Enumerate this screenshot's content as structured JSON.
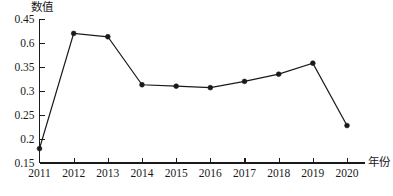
{
  "chart_data": {
    "type": "line",
    "title": "",
    "xlabel": "年份",
    "ylabel": "数值",
    "categories": [
      "2011",
      "2012",
      "2013",
      "2014",
      "2015",
      "2016",
      "2017",
      "2018",
      "2019",
      "2020"
    ],
    "values": [
      0.18,
      0.42,
      0.413,
      0.313,
      0.31,
      0.307,
      0.32,
      0.335,
      0.358,
      0.228
    ],
    "series": [
      {
        "name": "数值",
        "values": [
          0.18,
          0.42,
          0.413,
          0.313,
          0.31,
          0.307,
          0.32,
          0.335,
          0.358,
          0.228
        ]
      }
    ],
    "ytick_labels": [
      "0.45",
      "0.6",
      "0.35",
      "0.3",
      "0.25",
      "0.2",
      "0.15"
    ],
    "ytick_positions": [
      0.45,
      0.4,
      0.35,
      0.3,
      0.25,
      0.2,
      0.15
    ],
    "ylim": [
      0.15,
      0.45
    ],
    "xlim": [
      "2011",
      "2020"
    ],
    "grid": false,
    "legend": "none",
    "marker": "filled-circle",
    "line_color": "#1a1a1a",
    "marker_color": "#1a1a1a",
    "axis_color": "#1a1a1a",
    "background_color": "#ffffff"
  },
  "axes": {
    "y_title": "数值",
    "x_title": "年份"
  }
}
